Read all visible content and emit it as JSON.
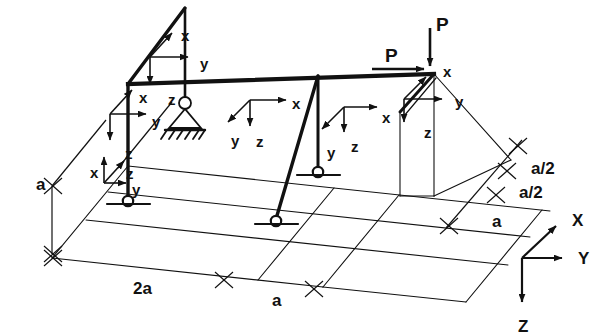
{
  "figure": {
    "stroke_color": "#111111",
    "background_color": "#ffffff"
  },
  "loads": [
    {
      "name": "load-vertical",
      "label": "P",
      "direction": "down",
      "x": 436,
      "y": 15
    },
    {
      "name": "load-horizontal",
      "label": "P",
      "direction": "right",
      "x": 385,
      "y": 46
    }
  ],
  "local_axes": [
    {
      "name": "apex-joint",
      "x": {
        "label": "x",
        "lx": 181,
        "ly": 28
      },
      "y": {
        "label": "y",
        "lx": 200,
        "ly": 56
      },
      "z": {
        "label": "z",
        "lx": 168,
        "ly": 92
      }
    },
    {
      "name": "left-column-top",
      "x": {
        "label": "x",
        "lx": 139,
        "ly": 90
      },
      "y": {
        "label": "y",
        "lx": 152,
        "ly": 114
      },
      "z": {
        "label": "z",
        "lx": 125,
        "ly": 146
      }
    },
    {
      "name": "left-column-base",
      "x": {
        "label": "x",
        "lx": 90,
        "ly": 165
      },
      "y": {
        "label": "y",
        "lx": 132,
        "ly": 182
      },
      "z": {
        "label": "z",
        "lx": 126,
        "ly": 166
      }
    },
    {
      "name": "beam-mid-left",
      "x": {
        "label": "x",
        "lx": 292,
        "ly": 96
      },
      "y": {
        "label": "y",
        "lx": 231,
        "ly": 133
      },
      "z": {
        "label": "z",
        "lx": 256,
        "ly": 134
      }
    },
    {
      "name": "inclined-column-top",
      "x": {
        "label": "x",
        "lx": 382,
        "ly": 110
      },
      "y": {
        "label": "y",
        "lx": 327,
        "ly": 145
      },
      "z": {
        "label": "z",
        "lx": 351,
        "ly": 139
      }
    },
    {
      "name": "right-joint",
      "x": {
        "label": "x",
        "lx": 443,
        "ly": 64
      },
      "y": {
        "label": "y",
        "lx": 455,
        "ly": 94
      },
      "z": {
        "label": "z",
        "lx": 424,
        "ly": 125
      }
    }
  ],
  "dimensions": [
    {
      "name": "height-a",
      "label": "a",
      "lx": 36,
      "ly": 176
    },
    {
      "name": "span-2a",
      "label": "2a",
      "lx": 133,
      "ly": 280
    },
    {
      "name": "span-a",
      "label": "a",
      "lx": 272,
      "ly": 292
    },
    {
      "name": "depth-a-half-far",
      "label": "a/2",
      "lx": 531,
      "ly": 160
    },
    {
      "name": "depth-a-half-near",
      "label": "a/2",
      "lx": 519,
      "ly": 184
    },
    {
      "name": "depth-a",
      "label": "a",
      "lx": 492,
      "ly": 213
    }
  ],
  "global_axes": {
    "name": "global-coordinate-triad",
    "origin": {
      "x": 522,
      "y": 258
    },
    "x": {
      "label": "X",
      "lx": 572,
      "ly": 212
    },
    "y": {
      "label": "Y",
      "lx": 578,
      "ly": 250
    },
    "z": {
      "label": "Z",
      "lx": 518,
      "ly": 318
    }
  },
  "supports": [
    {
      "name": "roller-support-apex-column",
      "type": "pinned-hatched",
      "x": 185,
      "y": 105
    },
    {
      "name": "pin-support-left-column",
      "type": "pin",
      "x": 99,
      "y": 203
    },
    {
      "name": "pin-support-vertical-column",
      "type": "pin",
      "x": 318,
      "y": 175
    },
    {
      "name": "pin-support-inclined-column",
      "type": "pin",
      "x": 275,
      "y": 224
    }
  ]
}
